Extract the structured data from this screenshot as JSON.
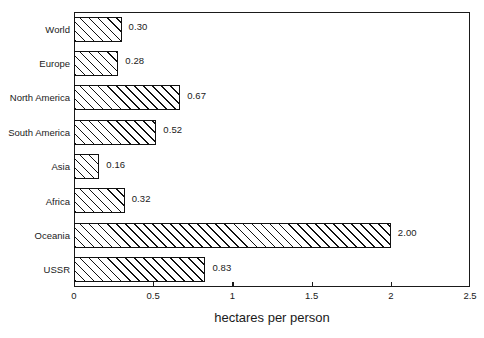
{
  "chart_data": {
    "type": "bar",
    "orientation": "horizontal",
    "title": "",
    "xlabel": "hectares per person",
    "ylabel": "",
    "categories": [
      "World",
      "Europe",
      "North America",
      "South America",
      "Asia",
      "Africa",
      "Oceania",
      "USSR"
    ],
    "values": [
      0.3,
      0.28,
      0.67,
      0.52,
      0.16,
      0.32,
      2.0,
      0.83
    ],
    "value_labels": [
      "0.30",
      "0.28",
      "0.67",
      "0.52",
      "0.16",
      "0.32",
      "2.00",
      "0.83"
    ],
    "xlim": [
      0,
      2.5
    ],
    "xticks": [
      0,
      0.5,
      1,
      1.5,
      2,
      2.5
    ],
    "xtick_labels": [
      "0",
      "0.5",
      "1",
      "1.5",
      "2",
      "2.5"
    ],
    "grid": false,
    "legend": null,
    "bar_fill": "diagonal-hatch",
    "colors": {
      "axis": "#1a1a1a",
      "bar_edge": "#111111",
      "bar_face": "#ffffff",
      "hatch": "#111111",
      "background": "#ffffff",
      "text": "#1a1a1a"
    }
  }
}
